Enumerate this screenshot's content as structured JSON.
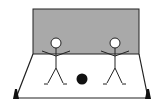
{
  "diagram": {
    "title": "",
    "colors": {
      "wall_fill": "#a9a9a9",
      "wall_stroke": "#222222",
      "floor_fill": "#ffffff",
      "line": "#222222",
      "ball": "#111111",
      "cone": "#111111",
      "head_fill": "#ffffff"
    },
    "elements": {
      "wall": {
        "label": "wall"
      },
      "floor": {
        "label": "playing area"
      },
      "players": [
        {
          "label": "player-left"
        },
        {
          "label": "player-right"
        }
      ],
      "ball": {
        "label": "ball"
      },
      "cones": [
        {
          "label": "cone-left"
        },
        {
          "label": "cone-right"
        }
      ]
    }
  }
}
